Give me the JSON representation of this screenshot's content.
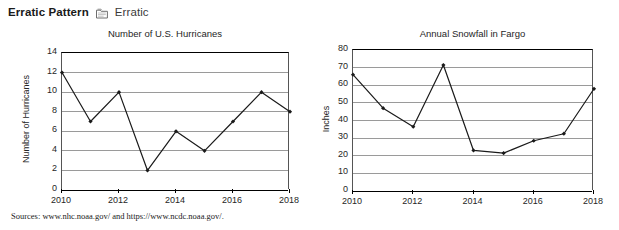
{
  "header": {
    "title": "Erratic Pattern",
    "icon": "document-frame-icon",
    "subtitle": "Erratic"
  },
  "sources": {
    "text": "Sources: www.nhc.noaa.gov/ and https://www.ncdc.noaa.gov/."
  },
  "chart_data": [
    {
      "type": "line",
      "title": "Number of U.S. Hurricanes",
      "xlabel": "",
      "ylabel": "Number of Hurricanes",
      "x": [
        2010,
        2011,
        2012,
        2013,
        2014,
        2015,
        2016,
        2017,
        2018
      ],
      "values": [
        12,
        7,
        10,
        2,
        6,
        4,
        7,
        10,
        8
      ],
      "ylim": [
        0,
        14
      ],
      "yticks": [
        0,
        2,
        4,
        6,
        8,
        10,
        12,
        14
      ],
      "xticks": [
        "2010",
        "2012",
        "2014",
        "2016",
        "2018"
      ],
      "xlim": [
        2010,
        2018
      ],
      "grid": "horizontal",
      "legend": "none",
      "line_color": "#1a1a1a",
      "marker": "diamond"
    },
    {
      "type": "line",
      "title": "Annual Snowfall in Fargo",
      "xlabel": "",
      "ylabel": "Inches",
      "x": [
        2010,
        2011,
        2012,
        2013,
        2014,
        2015,
        2016,
        2017,
        2018
      ],
      "values": [
        66,
        47,
        36.5,
        71.5,
        23,
        21.5,
        28.5,
        32.5,
        58
      ],
      "ylim": [
        0,
        80
      ],
      "yticks": [
        0,
        10,
        20,
        30,
        40,
        50,
        60,
        70,
        80
      ],
      "xticks": [
        "2010",
        "2012",
        "2014",
        "2016",
        "2018"
      ],
      "xlim": [
        2010,
        2018
      ],
      "grid": "horizontal",
      "legend": "none",
      "line_color": "#1a1a1a",
      "marker": "diamond"
    }
  ],
  "layout": {
    "charts": [
      {
        "plot": {
          "left": 61,
          "top": 52,
          "width": 228,
          "height": 137
        },
        "title_top": 28,
        "title_left": 20,
        "title_width": 290,
        "ylabel_cx": 26,
        "ylabel_cy": 120
      },
      {
        "plot": {
          "left": 352,
          "top": 49,
          "width": 241,
          "height": 141
        },
        "title_top": 28,
        "title_left": 330,
        "title_width": 285,
        "ylabel_cx": 326,
        "ylabel_cy": 120
      }
    ]
  }
}
